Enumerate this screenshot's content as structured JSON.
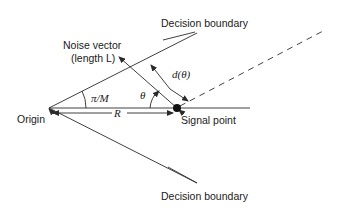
{
  "diagram": {
    "labels": {
      "decision_boundary_top": "Decision boundary",
      "decision_boundary_bottom": "Decision boundary",
      "noise_vector_line1": "Noise vector",
      "noise_vector_line2": "(length L)",
      "origin": "Origin",
      "signal_point": "Signal point",
      "angle_half_sector": "π/M",
      "angle_theta": "θ",
      "radius": "R",
      "distance": "d(θ)"
    }
  }
}
